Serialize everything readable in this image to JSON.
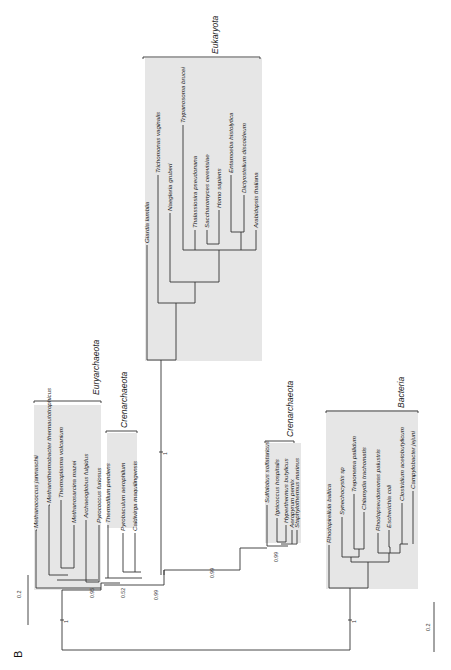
{
  "figure": {
    "panel_label": "B",
    "scale_bar": {
      "label": "0.2"
    },
    "scale_bar_bottom": {
      "label": "0.2"
    },
    "clades": {
      "euryarchaeota": "Euryarchaeota",
      "crenarchaeota_top": "Crenarchaeota",
      "crenarchaeota_mid": "Crenarchaeota",
      "eukaryota": "Eukaryota",
      "bacteria": "Bacteria"
    },
    "taxa": {
      "euryarchaeota": [
        "Methanococcus jannaschii",
        "Methanothermobacter thermautotrophicus",
        "Thermoplasma volcanium",
        "Methanosarcina mazei",
        "Archaeoglobus fulgidus",
        "Pyrococcus furiosus"
      ],
      "crenarchaeota_top": [
        "Thermofilum pendens",
        "Pyrobaculum aerophilum",
        "Caldivirga maquilingensis"
      ],
      "eukaryota": [
        "Giardia lamblia",
        "Trichomonas vaginalis",
        "Naegleria gruberi",
        "Trypanosoma brucei",
        "Thalassiosira pseudonana",
        "Saccharomyces cerevisiae",
        "Homo sapiens",
        "Entamoeba histolytica",
        "Dictyostelium discoideum",
        "Arabidopsis thaliana"
      ],
      "crenarchaeota_mid": [
        "Sulfolobus solfataricus",
        "Ignicoccus hospitalis",
        "Hyperthermus butylicus",
        "Aeropyrum pernix",
        "Staphylothermus marinus"
      ],
      "bacteria": [
        "Rhodopirellula baltica",
        "Synechocystis sp",
        "Treponema pallidum",
        "Chlamydia trachomatis",
        "Rhodopseudomonas palustris",
        "Escherichia coli",
        "Clostridium acetobutylicum",
        "Campylobacter jejuni"
      ]
    },
    "support_values": {
      "eury_base": "0.95",
      "cren_top_base": "0.52",
      "arch_node": "0.99",
      "cren_mid_node": "0.99",
      "cren_mid_inner": "0.99",
      "root_archaea": "1",
      "root_bacteria": "1",
      "euk_branch": "1"
    }
  }
}
